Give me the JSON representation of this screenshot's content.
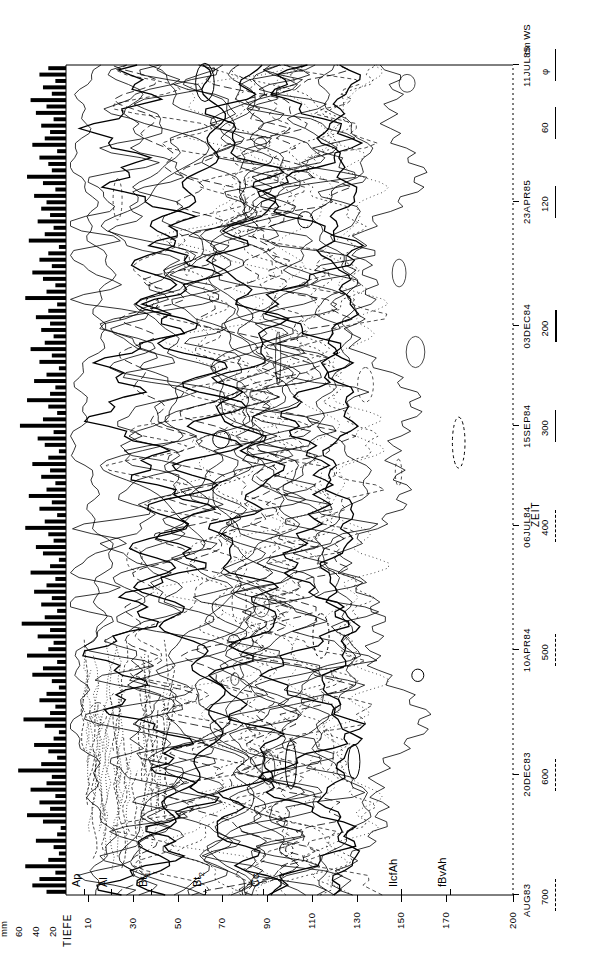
{
  "figure": {
    "orientation": "rotated-90-ccw",
    "background": "#ffffff",
    "ink": "#000000"
  },
  "axes": {
    "depth_axis_title": "TIEFE",
    "depth_axis_unit": "cm",
    "depth_ticks": [
      "10",
      "30",
      "50",
      "70",
      "90",
      "110",
      "130",
      "150",
      "170",
      "200"
    ],
    "depth_values": [
      10,
      30,
      50,
      70,
      90,
      110,
      130,
      150,
      170,
      200
    ],
    "time_axis_title": "ZEIT",
    "time_ticks": [
      "AUG83",
      "20DEC83",
      "10APR84",
      "06JUL84",
      "15SEP84",
      "03DEC84",
      "23APR85",
      "11JUL85"
    ],
    "precip_axis_title": "mm",
    "precip_ticks": [
      "60",
      "40",
      "20"
    ],
    "precip_values": [
      60,
      40,
      20
    ]
  },
  "legend": {
    "unit_label": "cm",
    "series_label": "WS",
    "entries": [
      {
        "label": "700",
        "style": "dotted"
      },
      {
        "label": "600",
        "style": "dashed-fine"
      },
      {
        "label": "500",
        "style": "dashed"
      },
      {
        "label": "400",
        "style": "dashed-long"
      },
      {
        "label": "300",
        "style": "solid"
      },
      {
        "label": "200",
        "style": "solid-thick"
      },
      {
        "label": "120",
        "style": "solid"
      },
      {
        "label": "60",
        "style": "solid"
      },
      {
        "label": "φ",
        "style": "solid"
      }
    ]
  },
  "horizons": [
    {
      "label": "Ap",
      "depth_cm": 8
    },
    {
      "label": "Al",
      "depth_cm": 20
    },
    {
      "label": "Bt1",
      "depth_cm": 38
    },
    {
      "label": "Bt2",
      "depth_cm": 62
    },
    {
      "label": "Cc",
      "depth_cm": 88
    },
    {
      "label": "IIcfAh",
      "depth_cm": 150
    },
    {
      "label": "fBvAh",
      "depth_cm": 172
    }
  ],
  "chart_data": {
    "type": "contour-with-bars",
    "title": "",
    "xlabel": "ZEIT",
    "ylabel": "TIEFE (cm)",
    "ylim": [
      0,
      200
    ],
    "y_inverted": true,
    "xlim": [
      "AUG83",
      "11JUL85"
    ],
    "grid": false,
    "legend_position": "bottom-right",
    "contour_levels_cm_WS": [
      60,
      120,
      200,
      300,
      400,
      500,
      600,
      700
    ],
    "series": [
      {
        "name": "Niederschlag (mm)",
        "type": "bar",
        "unit": "mm",
        "ylim": [
          0,
          70
        ],
        "values": [
          22,
          38,
          30,
          12,
          46,
          20,
          8,
          14,
          34,
          10,
          6,
          26,
          44,
          18,
          30,
          12,
          40,
          22,
          16,
          54,
          28,
          10,
          20,
          36,
          14,
          8,
          24,
          48,
          18,
          12,
          30,
          22,
          8,
          16,
          38,
          26,
          10,
          44,
          20,
          14,
          32,
          18,
          50,
          24,
          10,
          28,
          16,
          36,
          22,
          12,
          40,
          18,
          8,
          26,
          34,
          14,
          20,
          46,
          24,
          10,
          30,
          16,
          42,
          22,
          12,
          28,
          18,
          38,
          20,
          8,
          24,
          32,
          14,
          52,
          26,
          10,
          20,
          44,
          18,
          12,
          36,
          22,
          8,
          30,
          16,
          40,
          24,
          14,
          28,
          18,
          34,
          20,
          10,
          46,
          22,
          12,
          26,
          38,
          16,
          30,
          20,
          8,
          42,
          24,
          14,
          32,
          18,
          28,
          22,
          36,
          12,
          26,
          44,
          16,
          20,
          30,
          10,
          38,
          24,
          18,
          28,
          14,
          34,
          22,
          40,
          16,
          26,
          12,
          30,
          20
        ]
      },
      {
        "name": "Wasserspannung (cm WS)",
        "type": "contour",
        "unit": "cm WS",
        "description": "Isoplethen der Wasserspannung in Abhaengigkeit von Tiefe und Zeit"
      }
    ]
  }
}
